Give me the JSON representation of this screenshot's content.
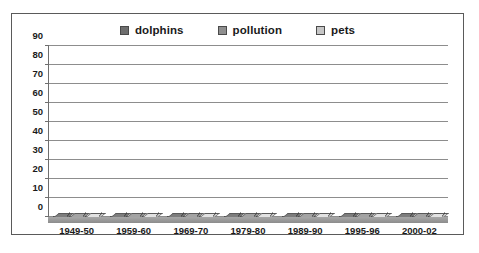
{
  "chart_data": {
    "type": "bar",
    "title": "",
    "subtitle": "",
    "xlabel": "",
    "ylabel": "",
    "ylim": [
      0,
      90
    ],
    "yticks": [
      0,
      10,
      20,
      30,
      40,
      50,
      60,
      70,
      80,
      90
    ],
    "grid": true,
    "legend_position": "top-center",
    "categories": [
      "1949-50",
      "1959-60",
      "1969-70",
      "1979-80",
      "1989-90",
      "1995-96",
      "2000-02"
    ],
    "series": [
      {
        "name": "dolphins",
        "color": "#6e6e6e",
        "values": [
          0,
          0,
          0,
          3,
          11,
          11,
          11
        ]
      },
      {
        "name": "pollution",
        "color": "#8f8f8f",
        "values": [
          17,
          25,
          44,
          54,
          71,
          57,
          66
        ]
      },
      {
        "name": "pets",
        "color": "#c6c6c6",
        "values": [
          82,
          73,
          54,
          41,
          16,
          30,
          22
        ]
      }
    ]
  },
  "legend": {
    "items": [
      {
        "label": "dolphins",
        "swatch_icon": "legend-swatch-icon",
        "color": "#6e6e6e"
      },
      {
        "label": "pollution",
        "swatch_icon": "legend-swatch-icon",
        "color": "#8f8f8f"
      },
      {
        "label": "pets",
        "swatch_icon": "legend-swatch-icon",
        "color": "#c6c6c6"
      }
    ]
  },
  "colors": {
    "frame_border": "#5a5a5a",
    "gridline": "#8d8d8d",
    "axis": "#6e6e6e",
    "bar_outline": "#4f4f4f",
    "floor": "#9a9a9a",
    "background": "#ffffff",
    "text": "#1a1a1a"
  }
}
